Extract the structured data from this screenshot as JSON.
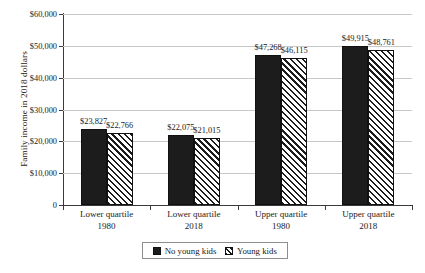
{
  "chart_data": {
    "type": "bar",
    "title": "",
    "xlabel": "",
    "ylabel": "Family income in 2018 dollars",
    "ylim": [
      0,
      60000
    ],
    "ytick_step": 10000,
    "ytick_labels": [
      "$60,000",
      "$50,000",
      "$40,000",
      "$30,000",
      "$20,000",
      "$10,000",
      "0"
    ],
    "ytick_values": [
      60000,
      50000,
      40000,
      30000,
      20000,
      10000,
      0
    ],
    "grid": "horizontal",
    "legend_position": "bottom-center",
    "categories": [
      {
        "line1": "Lower quartile",
        "line2": "1980"
      },
      {
        "line1": "Lower quartile",
        "line2": "2018"
      },
      {
        "line1": "Upper quartile",
        "line2": "1980"
      },
      {
        "line1": "Upper quartile",
        "line2": "2018"
      }
    ],
    "series": [
      {
        "name": "No young kids",
        "fill": "solid",
        "color": "#1c1c1c",
        "values": [
          23827,
          22075,
          47268,
          49915
        ],
        "labels": [
          "$23,827",
          "$22,075",
          "$47,268",
          "$49,915"
        ]
      },
      {
        "name": "Young kids",
        "fill": "diagonal-hatch",
        "color": "#1c1c1c",
        "values": [
          22766,
          21015,
          46115,
          48761
        ],
        "labels": [
          "$22,766",
          "$21,015",
          "$46,115",
          "$48,761"
        ]
      }
    ]
  },
  "legend": {
    "items": [
      {
        "label": "No young kids",
        "swatch": "solid-square-icon"
      },
      {
        "label": "Young kids",
        "swatch": "hatched-square-icon"
      }
    ]
  }
}
